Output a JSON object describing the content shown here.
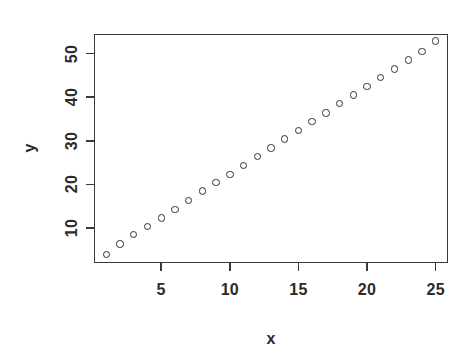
{
  "chart_data": {
    "type": "scatter",
    "title": "",
    "subtitle": "",
    "xlabel": "x",
    "ylabel": "y",
    "xlim": [
      0.1,
      25.9
    ],
    "ylim": [
      2.0,
      54.5
    ],
    "xticks": [
      5,
      10,
      15,
      20,
      25
    ],
    "yticks": [
      10,
      20,
      30,
      40,
      50
    ],
    "xtick_labels": [
      "5",
      "10",
      "15",
      "20",
      "25"
    ],
    "ytick_labels": [
      "10",
      "20",
      "30",
      "40",
      "50"
    ],
    "grid": false,
    "legend": null,
    "marker": "open-circle",
    "marker_color": "#2e2e2e",
    "box_color": "#3a3a3a",
    "background": "#ffffff",
    "x": [
      1,
      2,
      3,
      4,
      5,
      6,
      7,
      8,
      9,
      10,
      11,
      12,
      13,
      14,
      15,
      16,
      17,
      18,
      19,
      20,
      21,
      22,
      23,
      24,
      25
    ],
    "y": [
      3.9,
      6.4,
      8.5,
      10.3,
      12.3,
      14.3,
      16.4,
      18.5,
      20.4,
      22.3,
      24.3,
      26.4,
      28.4,
      30.4,
      32.4,
      34.4,
      36.4,
      38.5,
      40.5,
      42.5,
      44.5,
      46.5,
      48.5,
      50.5,
      52.9
    ]
  }
}
